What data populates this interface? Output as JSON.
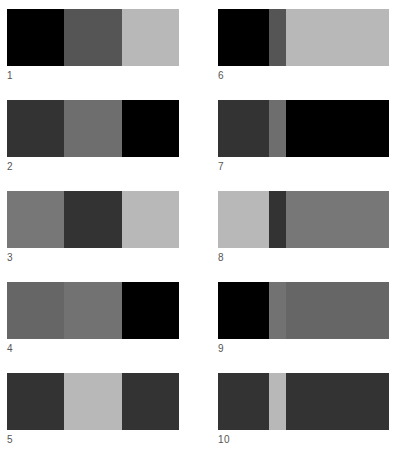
{
  "figure": {
    "panels": [
      {
        "label": "1",
        "column": "left",
        "segments": [
          {
            "width": 57,
            "color": "#000000"
          },
          {
            "width": 58,
            "color": "#555555"
          },
          {
            "width": 57,
            "color": "#b8b8b8"
          }
        ]
      },
      {
        "label": "2",
        "column": "left",
        "segments": [
          {
            "width": 57,
            "color": "#333333"
          },
          {
            "width": 58,
            "color": "#6e6e6e"
          },
          {
            "width": 57,
            "color": "#000000"
          }
        ]
      },
      {
        "label": "3",
        "column": "left",
        "segments": [
          {
            "width": 57,
            "color": "#777777"
          },
          {
            "width": 58,
            "color": "#333333"
          },
          {
            "width": 57,
            "color": "#b8b8b8"
          }
        ]
      },
      {
        "label": "4",
        "column": "left",
        "segments": [
          {
            "width": 57,
            "color": "#666666"
          },
          {
            "width": 58,
            "color": "#727272"
          },
          {
            "width": 57,
            "color": "#000000"
          }
        ]
      },
      {
        "label": "5",
        "column": "left",
        "segments": [
          {
            "width": 57,
            "color": "#333333"
          },
          {
            "width": 58,
            "color": "#b8b8b8"
          },
          {
            "width": 57,
            "color": "#333333"
          }
        ]
      },
      {
        "label": "6",
        "column": "right",
        "segments": [
          {
            "width": 51,
            "color": "#000000"
          },
          {
            "width": 17,
            "color": "#555555"
          },
          {
            "width": 103,
            "color": "#b8b8b8"
          }
        ]
      },
      {
        "label": "7",
        "column": "right",
        "segments": [
          {
            "width": 51,
            "color": "#333333"
          },
          {
            "width": 17,
            "color": "#6e6e6e"
          },
          {
            "width": 103,
            "color": "#000000"
          }
        ]
      },
      {
        "label": "8",
        "column": "right",
        "segments": [
          {
            "width": 51,
            "color": "#b8b8b8"
          },
          {
            "width": 17,
            "color": "#333333"
          },
          {
            "width": 103,
            "color": "#777777"
          }
        ]
      },
      {
        "label": "9",
        "column": "right",
        "segments": [
          {
            "width": 51,
            "color": "#000000"
          },
          {
            "width": 17,
            "color": "#727272"
          },
          {
            "width": 103,
            "color": "#666666"
          }
        ]
      },
      {
        "label": "10",
        "column": "right",
        "segments": [
          {
            "width": 51,
            "color": "#333333"
          },
          {
            "width": 17,
            "color": "#b8b8b8"
          },
          {
            "width": 103,
            "color": "#333333"
          }
        ]
      }
    ]
  }
}
